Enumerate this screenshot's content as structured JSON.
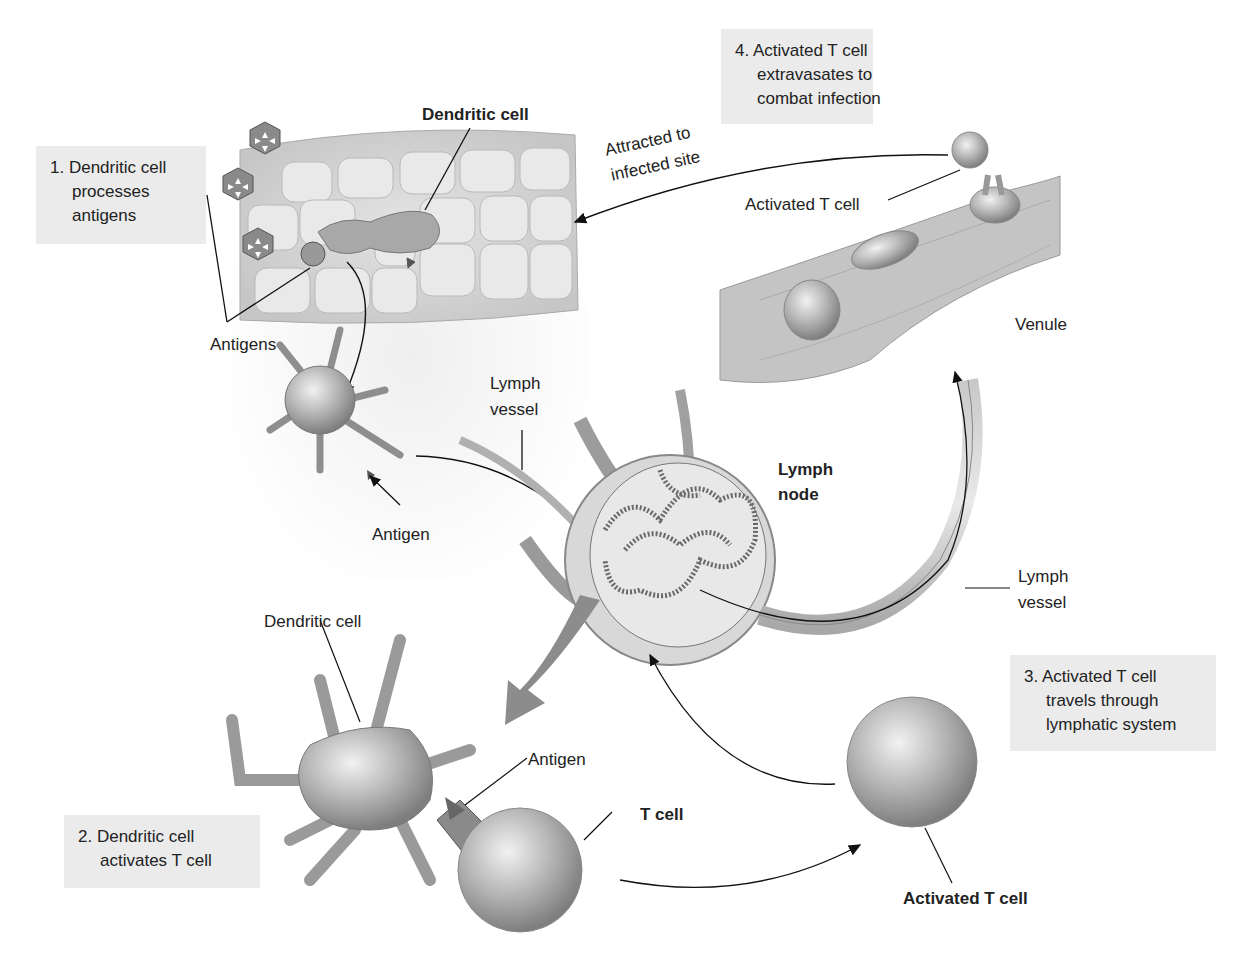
{
  "steps": [
    {
      "number": "1.",
      "lines": [
        "Dendritic cell",
        "processes",
        "antigens"
      ]
    },
    {
      "number": "2.",
      "lines": [
        "Dendritic cell",
        "activates T cell"
      ]
    },
    {
      "number": "3.",
      "lines": [
        "Activated T cell",
        "travels through",
        "lymphatic system"
      ]
    },
    {
      "number": "4.",
      "lines": [
        "Activated T cell",
        "extravasates to",
        "combat infection"
      ]
    }
  ],
  "labels": {
    "dendritic_cell_top": "Dendritic cell",
    "antigens": "Antigens",
    "antigen_mid": "Antigen",
    "lymph_vessel_left_1": "Lymph",
    "lymph_vessel_left_2": "vessel",
    "lymph_node_1": "Lymph",
    "lymph_node_2": "node",
    "lymph_vessel_right_1": "Lymph",
    "lymph_vessel_right_2": "vessel",
    "dendritic_cell_bottom": "Dendritic cell",
    "antigen_bottom": "Antigen",
    "t_cell": "T cell",
    "activated_t_cell_bottom": "Activated T cell",
    "activated_t_cell_top": "Activated T cell",
    "venule": "Venule",
    "attracted_1": "Attracted to",
    "attracted_2": "infected site"
  },
  "colors": {
    "box_fill": "#ebebeb",
    "cell_gray": "#9a9a9a",
    "arrow_gray": "#8c8c8c",
    "text": "#222222"
  }
}
